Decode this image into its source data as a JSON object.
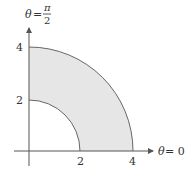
{
  "diagram": {
    "type": "polar-region",
    "colors": {
      "fill": "#e6e6e6",
      "arc_stroke": "#666666",
      "axis_stroke": "#555555",
      "text": "#333333"
    },
    "axes": {
      "horizontal_label_theta": "θ",
      "horizontal_label_eq": "= 0",
      "vertical_label_theta": "θ",
      "vertical_label_eq": "=",
      "vertical_label_num": "π",
      "vertical_label_den": "2"
    },
    "ticks": {
      "x": [
        "2",
        "4"
      ],
      "y": [
        "2",
        "4"
      ]
    },
    "region": {
      "inner_radius": 2,
      "outer_radius": 4,
      "theta_start": "0",
      "theta_end": "π/2"
    }
  }
}
